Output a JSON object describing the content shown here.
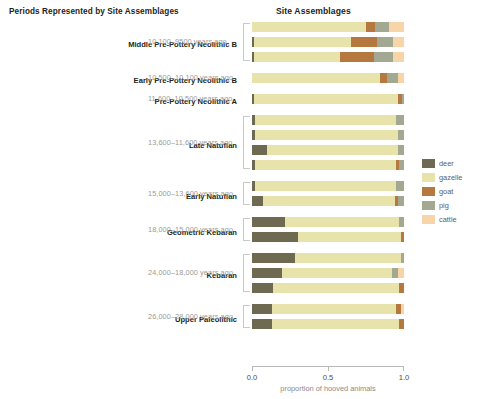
{
  "left_panel_title": "Periods Represented by Site Assemblages",
  "chart_title": "Site Assemblages",
  "axis": {
    "title": "proportion of hooved animals",
    "ticks": [
      "0.0",
      "0.5",
      "1.0"
    ],
    "tick_values": [
      0.0,
      0.5,
      1.0
    ]
  },
  "legend": {
    "items": [
      {
        "label": "deer",
        "color": "#6e6a51"
      },
      {
        "label": "gazelle",
        "color": "#e8e3ab"
      },
      {
        "label": "goat",
        "color": "#b5783e"
      },
      {
        "label": "pig",
        "color": "#a3a893"
      },
      {
        "label": "cattle",
        "color": "#f8d5a8"
      }
    ]
  },
  "periods": [
    {
      "name": "Middle Pre-Pottery Neolithic B",
      "range": "10,100–9500 years ago",
      "n_bars": 3,
      "bracketed": true
    },
    {
      "name": "Early Pre-Pottery Neolithic B",
      "range": "10,500–10,100 years ago",
      "n_bars": 1,
      "bracketed": false
    },
    {
      "name": "Pre-Pottery Neolithic A",
      "range": "11,600–10,500 years ago",
      "n_bars": 1,
      "bracketed": false
    },
    {
      "name": "Late Natufian",
      "range": "13,600–11,600 years ago",
      "n_bars": 4,
      "bracketed": true
    },
    {
      "name": "Early Natufian",
      "range": "15,000–13,600 years ago",
      "n_bars": 2,
      "bracketed": true
    },
    {
      "name": "Geometric Kebaran",
      "range": "18,000–15,000 years ago",
      "n_bars": 2,
      "bracketed": true
    },
    {
      "name": "Kebaran",
      "range": "24,000–18,000 years ago",
      "n_bars": 3,
      "bracketed": true
    },
    {
      "name": "Upper Paleolithic",
      "range": "26,000–28,000 years ago",
      "n_bars": 2,
      "bracketed": true
    }
  ],
  "chart_data": {
    "type": "bar",
    "orientation": "horizontal",
    "stacked": true,
    "normalized": true,
    "title": "Site Assemblages",
    "xlabel": "proportion of hooved animals",
    "ylabel": "",
    "xlim": [
      0.0,
      1.0
    ],
    "grid": false,
    "legend_position": "right",
    "series_names": [
      "deer",
      "gazelle",
      "goat",
      "pig",
      "cattle"
    ],
    "series_colors": [
      "#6e6a51",
      "#e8e3ab",
      "#b5783e",
      "#a3a893",
      "#f8d5a8"
    ],
    "categories": [
      "Middle Pre-Pottery Neolithic B",
      "Early Pre-Pottery Neolithic B",
      "Pre-Pottery Neolithic A",
      "Late Natufian",
      "Early Natufian",
      "Geometric Kebaran",
      "Kebaran",
      "Upper Paleolithic"
    ],
    "bars": [
      {
        "period": "Middle Pre-Pottery Neolithic B",
        "values": {
          "deer": 0.0,
          "gazelle": 0.75,
          "goat": 0.06,
          "pig": 0.09,
          "cattle": 0.1
        }
      },
      {
        "period": "Middle Pre-Pottery Neolithic B",
        "values": {
          "deer": 0.01,
          "gazelle": 0.64,
          "goat": 0.17,
          "pig": 0.11,
          "cattle": 0.07
        }
      },
      {
        "period": "Middle Pre-Pottery Neolithic B",
        "values": {
          "deer": 0.01,
          "gazelle": 0.57,
          "goat": 0.22,
          "pig": 0.13,
          "cattle": 0.07
        }
      },
      {
        "period": "Early Pre-Pottery Neolithic B",
        "values": {
          "deer": 0.0,
          "gazelle": 0.84,
          "goat": 0.05,
          "pig": 0.07,
          "cattle": 0.04
        }
      },
      {
        "period": "Pre-Pottery Neolithic A",
        "values": {
          "deer": 0.01,
          "gazelle": 0.95,
          "goat": 0.03,
          "pig": 0.01,
          "cattle": 0.0
        }
      },
      {
        "period": "Late Natufian",
        "values": {
          "deer": 0.02,
          "gazelle": 0.93,
          "goat": 0.0,
          "pig": 0.05,
          "cattle": 0.0
        }
      },
      {
        "period": "Late Natufian",
        "values": {
          "deer": 0.02,
          "gazelle": 0.94,
          "goat": 0.0,
          "pig": 0.04,
          "cattle": 0.0
        }
      },
      {
        "period": "Late Natufian",
        "values": {
          "deer": 0.1,
          "gazelle": 0.86,
          "goat": 0.0,
          "pig": 0.04,
          "cattle": 0.0
        }
      },
      {
        "period": "Late Natufian",
        "values": {
          "deer": 0.02,
          "gazelle": 0.93,
          "goat": 0.02,
          "pig": 0.03,
          "cattle": 0.0
        }
      },
      {
        "period": "Early Natufian",
        "values": {
          "deer": 0.02,
          "gazelle": 0.93,
          "goat": 0.0,
          "pig": 0.05,
          "cattle": 0.0
        }
      },
      {
        "period": "Early Natufian",
        "values": {
          "deer": 0.07,
          "gazelle": 0.87,
          "goat": 0.02,
          "pig": 0.04,
          "cattle": 0.0
        }
      },
      {
        "period": "Geometric Kebaran",
        "values": {
          "deer": 0.22,
          "gazelle": 0.75,
          "goat": 0.0,
          "pig": 0.03,
          "cattle": 0.0
        }
      },
      {
        "period": "Geometric Kebaran",
        "values": {
          "deer": 0.3,
          "gazelle": 0.68,
          "goat": 0.02,
          "pig": 0.0,
          "cattle": 0.0
        }
      },
      {
        "period": "Kebaran",
        "values": {
          "deer": 0.28,
          "gazelle": 0.7,
          "goat": 0.0,
          "pig": 0.02,
          "cattle": 0.0
        }
      },
      {
        "period": "Kebaran",
        "values": {
          "deer": 0.2,
          "gazelle": 0.72,
          "goat": 0.0,
          "pig": 0.04,
          "cattle": 0.04
        }
      },
      {
        "period": "Kebaran",
        "values": {
          "deer": 0.14,
          "gazelle": 0.83,
          "goat": 0.03,
          "pig": 0.0,
          "cattle": 0.0
        }
      },
      {
        "period": "Upper Paleolithic",
        "values": {
          "deer": 0.13,
          "gazelle": 0.82,
          "goat": 0.03,
          "pig": 0.0,
          "cattle": 0.02
        }
      },
      {
        "period": "Upper Paleolithic",
        "values": {
          "deer": 0.13,
          "gazelle": 0.84,
          "goat": 0.03,
          "pig": 0.0,
          "cattle": 0.0
        }
      }
    ]
  }
}
